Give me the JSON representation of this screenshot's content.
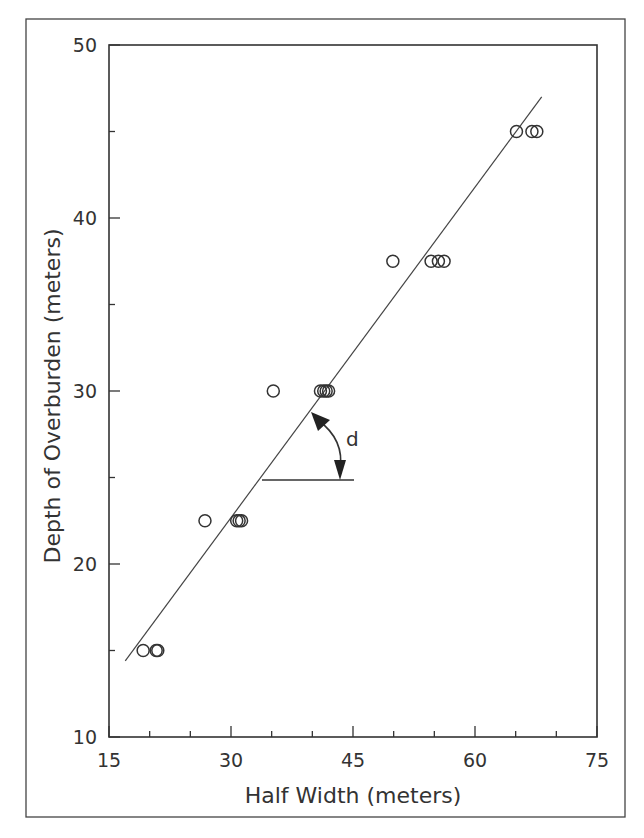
{
  "chart_data": {
    "type": "scatter",
    "title": "",
    "xlabel": "Half Width (meters)",
    "ylabel": "Depth of Overburden (meters)",
    "xlim": [
      15,
      75
    ],
    "ylim": [
      10,
      50
    ],
    "x_ticks": [
      15,
      30,
      45,
      60,
      75
    ],
    "x_minor_step": 5,
    "y_ticks": [
      10,
      20,
      30,
      40,
      50
    ],
    "y_minor_step": 5,
    "grid": false,
    "legend": null,
    "series": [
      {
        "name": "observations",
        "marker": "open-circle",
        "points": [
          {
            "x": 19.2,
            "y": 15.0
          },
          {
            "x": 20.8,
            "y": 15.0
          },
          {
            "x": 21.0,
            "y": 15.0
          },
          {
            "x": 26.8,
            "y": 22.5
          },
          {
            "x": 30.7,
            "y": 22.5
          },
          {
            "x": 31.0,
            "y": 22.5
          },
          {
            "x": 31.3,
            "y": 22.5
          },
          {
            "x": 35.2,
            "y": 30.0
          },
          {
            "x": 41.0,
            "y": 30.0
          },
          {
            "x": 41.4,
            "y": 30.0
          },
          {
            "x": 41.7,
            "y": 30.0
          },
          {
            "x": 42.0,
            "y": 30.0
          },
          {
            "x": 49.9,
            "y": 37.5
          },
          {
            "x": 54.6,
            "y": 37.5
          },
          {
            "x": 55.5,
            "y": 37.5
          },
          {
            "x": 56.2,
            "y": 37.5
          },
          {
            "x": 65.1,
            "y": 45.0
          },
          {
            "x": 67.0,
            "y": 45.0
          },
          {
            "x": 67.6,
            "y": 45.0
          }
        ]
      },
      {
        "name": "fit line",
        "type": "line",
        "points": [
          {
            "x": 17.0,
            "y": 14.4
          },
          {
            "x": 68.2,
            "y": 47.0
          }
        ]
      }
    ],
    "annotations": [
      {
        "type": "angle",
        "label": "d",
        "vertex": {
          "x": 34.0,
          "y": 25.0
        },
        "horizontal_to_x": 45.0,
        "description": "angle between fit line and horizontal, double-headed arc arrow"
      }
    ]
  },
  "labels": {
    "xlabel": "Half Width (meters)",
    "ylabel": "Depth of Overburden (meters)",
    "angle": "d",
    "x_tick_labels": [
      "15",
      "30",
      "45",
      "60",
      "75"
    ],
    "y_tick_labels": [
      "10",
      "20",
      "30",
      "40",
      "50"
    ]
  }
}
